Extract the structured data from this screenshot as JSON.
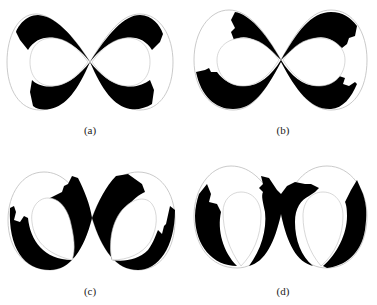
{
  "figure": {
    "panels": [
      {
        "id": "a",
        "label": "(a)"
      },
      {
        "id": "b",
        "label": "(b)"
      },
      {
        "id": "c",
        "label": "(c)"
      },
      {
        "id": "d",
        "label": "(d)"
      }
    ]
  },
  "colors": {
    "fill": "#000000",
    "outline": "#bdbdbd",
    "background": "#ffffff"
  }
}
